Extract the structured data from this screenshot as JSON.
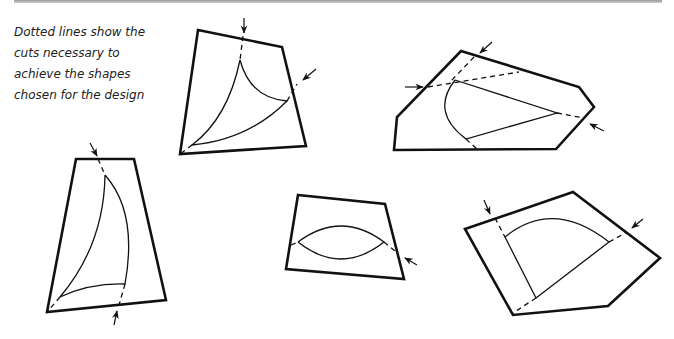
{
  "caption": {
    "text": "Dotted lines show the cuts necessary to achieve the shapes chosen for the design"
  },
  "figure": {
    "colors": {
      "stroke": "#111111",
      "background": "#ffffff",
      "rule": "#9a9a9a"
    },
    "pieces": [
      {
        "id": "top-middle",
        "inner_shape": "curved triangle (two concave arcs)",
        "cuts": 2
      },
      {
        "id": "top-right",
        "inner_shape": "half-lens / sector with straight sides",
        "cuts": 3
      },
      {
        "id": "bottom-left",
        "inner_shape": "sail shape",
        "cuts": 2
      },
      {
        "id": "bottom-middle",
        "inner_shape": "lens / almond",
        "cuts": 1
      },
      {
        "id": "bottom-right",
        "inner_shape": "quarter circle sector",
        "cuts": 2
      }
    ]
  }
}
